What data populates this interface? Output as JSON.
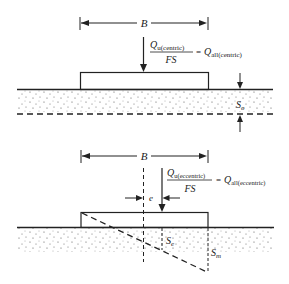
{
  "top_diagram": {
    "width_label": "B",
    "load_numerator": "Q",
    "load_numerator_sub": "u(centric)",
    "load_denominator": "FS",
    "equals": "=",
    "load_result": "Q",
    "load_result_sub": "all(centric)",
    "settlement_label": "S",
    "settlement_sub": "o"
  },
  "bottom_diagram": {
    "width_label": "B",
    "load_numerator": "Q",
    "load_numerator_sub": "u(eccentric)",
    "load_denominator": "FS",
    "equals": "=",
    "load_result": "Q",
    "load_result_sub": "all(eccentric)",
    "eccentricity_label": "e",
    "settlement_center_label": "S",
    "settlement_center_sub": "e",
    "settlement_max_label": "S",
    "settlement_max_sub": "m"
  },
  "colors": {
    "line": "#222222",
    "soil_dot": "#555555",
    "background": "#ffffff"
  }
}
